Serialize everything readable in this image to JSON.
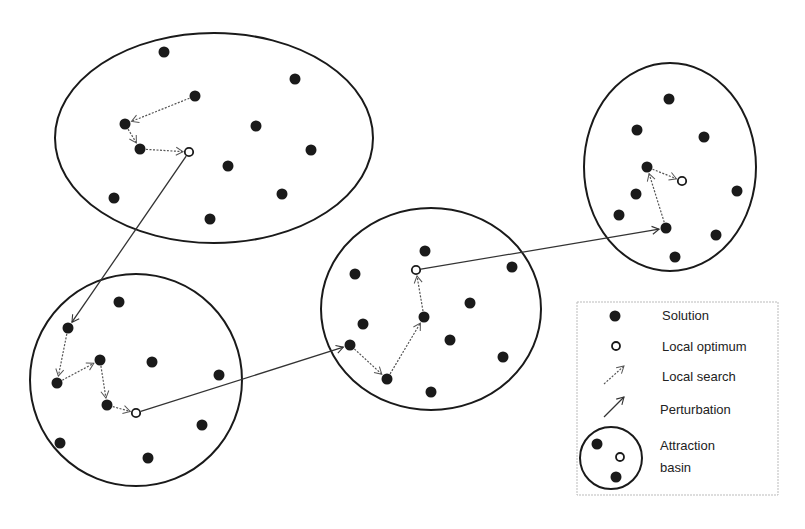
{
  "diagram": {
    "basins": [
      {
        "id": "basin-1",
        "shape": "ellipse",
        "cx": 214,
        "cy": 138,
        "rx": 159,
        "ry": 105,
        "solutions": [
          [
            164,
            52
          ],
          [
            295,
            79
          ],
          [
            195,
            96
          ],
          [
            125,
            124
          ],
          [
            256,
            126
          ],
          [
            311,
            150
          ],
          [
            140,
            149
          ],
          [
            228,
            166
          ],
          [
            282,
            194
          ],
          [
            114,
            198
          ],
          [
            210,
            219
          ]
        ],
        "local_optimum": [
          189,
          152
        ],
        "local_search_path": [
          [
            195,
            96
          ],
          [
            125,
            124
          ],
          [
            140,
            149
          ],
          [
            189,
            152
          ]
        ]
      },
      {
        "id": "basin-2",
        "shape": "ellipse",
        "cx": 136,
        "cy": 380,
        "rx": 106,
        "ry": 106,
        "solutions": [
          [
            119,
            302
          ],
          [
            68,
            328
          ],
          [
            100,
            360
          ],
          [
            152,
            362
          ],
          [
            57,
            383
          ],
          [
            219,
            375
          ],
          [
            107,
            405
          ],
          [
            202,
            425
          ],
          [
            60,
            443
          ],
          [
            148,
            458
          ]
        ],
        "local_optimum": [
          136,
          413
        ],
        "local_search_path": [
          [
            68,
            328
          ],
          [
            57,
            383
          ],
          [
            100,
            360
          ],
          [
            107,
            405
          ],
          [
            136,
            413
          ]
        ]
      },
      {
        "id": "basin-3",
        "shape": "ellipse",
        "cx": 431,
        "cy": 309,
        "rx": 110,
        "ry": 101,
        "solutions": [
          [
            425,
            251
          ],
          [
            355,
            274
          ],
          [
            512,
            267
          ],
          [
            470,
            303
          ],
          [
            424,
            317
          ],
          [
            363,
            324
          ],
          [
            350,
            345
          ],
          [
            450,
            340
          ],
          [
            503,
            357
          ],
          [
            387,
            379
          ],
          [
            431,
            392
          ]
        ],
        "local_optimum": [
          416,
          270
        ],
        "local_search_path": [
          [
            350,
            345
          ],
          [
            387,
            379
          ],
          [
            424,
            317
          ],
          [
            416,
            270
          ]
        ]
      },
      {
        "id": "basin-4",
        "shape": "ellipse",
        "cx": 670,
        "cy": 167,
        "rx": 86,
        "ry": 104,
        "solutions": [
          [
            669,
            99
          ],
          [
            637,
            130
          ],
          [
            704,
            137
          ],
          [
            647,
            167
          ],
          [
            636,
            194
          ],
          [
            619,
            215
          ],
          [
            737,
            191
          ],
          [
            666,
            228
          ],
          [
            716,
            235
          ],
          [
            675,
            257
          ]
        ],
        "local_optimum": [
          682,
          181
        ],
        "local_search_path": [
          [
            666,
            228
          ],
          [
            647,
            167
          ],
          [
            682,
            181
          ]
        ]
      }
    ],
    "perturbations": [
      {
        "from": [
          189,
          152
        ],
        "to": [
          68,
          328
        ]
      },
      {
        "from": [
          136,
          413
        ],
        "to": [
          350,
          345
        ]
      },
      {
        "from": [
          416,
          270
        ],
        "to": [
          666,
          228
        ]
      }
    ]
  },
  "legend": {
    "items": [
      {
        "symbol": "filled-dot",
        "label": "Solution"
      },
      {
        "symbol": "open-dot",
        "label": "Local optimum"
      },
      {
        "symbol": "dotted-arrow",
        "label": "Local search"
      },
      {
        "symbol": "solid-arrow",
        "label": "Perturbation"
      },
      {
        "symbol": "basin-circle",
        "label": "Attraction",
        "label2": "basin"
      }
    ]
  },
  "colors": {
    "ink": "#1a1a1a",
    "dotted": "#555555",
    "legend_border": "#bbbbbb"
  }
}
